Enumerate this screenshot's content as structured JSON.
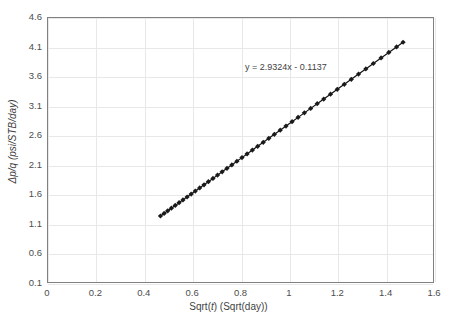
{
  "chart_data": {
    "type": "scatter",
    "title": "",
    "xlabel": "Sqrt(t)  (Sqrt(day))",
    "xlabel_parts": {
      "prefix": "Sqrt(",
      "italic": "t",
      "suffix": ")  (Sqrt(day))"
    },
    "ylabel": "Δp/q (psi/STB/day)",
    "xlim": [
      0,
      1.6
    ],
    "ylim": [
      0.1,
      4.6
    ],
    "xticks": [
      "0",
      "0.2",
      "0.4",
      "0.6",
      "0.8",
      "1",
      "1.2",
      "1.4",
      "1.6"
    ],
    "xtick_values": [
      0,
      0.2,
      0.4,
      0.6,
      0.8,
      1.0,
      1.2,
      1.4,
      1.6
    ],
    "yticks": [
      "0.1",
      "0.6",
      "1.1",
      "1.6",
      "2.1",
      "2.6",
      "3.1",
      "3.6",
      "4.1",
      "4.6"
    ],
    "ytick_values": [
      0.1,
      0.6,
      1.1,
      1.6,
      2.1,
      2.6,
      3.1,
      3.6,
      4.1,
      4.6
    ],
    "grid": true,
    "legend": "none",
    "annotations": [
      {
        "text": "y = 2.9324x - 0.1137",
        "x": 0.97,
        "y": 3.78
      }
    ],
    "trendline": {
      "slope": 2.9324,
      "intercept": -0.1137,
      "x_start": 0.465,
      "x_end": 1.468
    },
    "marker": {
      "shape": "diamond",
      "color": "#1a1a1a",
      "size": 2.6
    },
    "line": {
      "color": "#111111",
      "width": 1.2
    },
    "colors": {
      "axis": "#808080",
      "grid": "#e8e8e8",
      "text": "#4d4d4d",
      "series": "#1a1a1a",
      "background": "#ffffff"
    },
    "series": [
      {
        "name": "dp/q vs sqrt(t)",
        "x": [
          0.465,
          0.48,
          0.495,
          0.51,
          0.526,
          0.542,
          0.558,
          0.575,
          0.592,
          0.609,
          0.627,
          0.645,
          0.663,
          0.682,
          0.701,
          0.72,
          0.74,
          0.76,
          0.781,
          0.802,
          0.823,
          0.845,
          0.867,
          0.89,
          0.913,
          0.936,
          0.96,
          0.984,
          1.009,
          1.034,
          1.06,
          1.086,
          1.113,
          1.14,
          1.168,
          1.196,
          1.225,
          1.254,
          1.284,
          1.314,
          1.345,
          1.377,
          1.409,
          1.441,
          1.468
        ],
        "y": [
          1.25,
          1.294,
          1.338,
          1.382,
          1.429,
          1.476,
          1.523,
          1.572,
          1.622,
          1.672,
          1.725,
          1.778,
          1.831,
          1.886,
          1.942,
          1.998,
          2.057,
          2.115,
          2.177,
          2.238,
          2.3,
          2.365,
          2.429,
          2.497,
          2.564,
          2.632,
          2.702,
          2.772,
          2.846,
          2.919,
          2.995,
          3.071,
          3.15,
          3.229,
          3.311,
          3.393,
          3.478,
          3.563,
          3.651,
          3.739,
          3.83,
          3.924,
          4.018,
          4.111,
          4.19
        ]
      }
    ]
  }
}
